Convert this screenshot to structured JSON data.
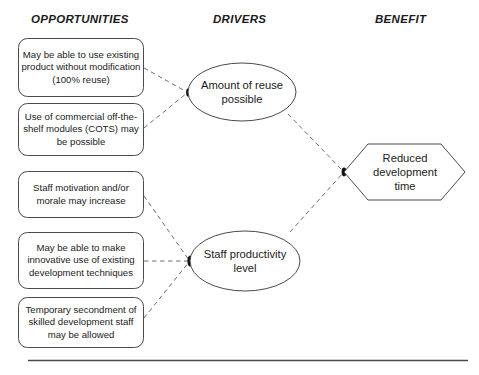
{
  "columns": {
    "opportunities": "OPPORTUNITIES",
    "drivers": "DRIVERS",
    "benefit": "BENEFIT"
  },
  "opportunities": [
    {
      "id": "opp-existing-product",
      "text": "May be able to use existing product without modification (100% reuse)"
    },
    {
      "id": "opp-cots-modules",
      "text": "Use of commercial off-the-shelf  modules (COTS) may be possible"
    },
    {
      "id": "opp-staff-motivation",
      "text": "Staff motivation and/or morale may increase"
    },
    {
      "id": "opp-innovative-use",
      "text": "May be able to make innovative use of existing development techniques"
    },
    {
      "id": "opp-secondment",
      "text": "Temporary secondment of skilled development staff may be allowed"
    }
  ],
  "drivers": [
    {
      "id": "driver-reuse",
      "text": "Amount of reuse possible"
    },
    {
      "id": "driver-productivity",
      "text": "Staff productivity level"
    }
  ],
  "benefits": [
    {
      "id": "benefit-reduced-time",
      "text": "Reduced development time"
    }
  ],
  "colors": {
    "stroke": "#3b3b3b",
    "connector": "#6e6e6e",
    "text": "#1b1b1b",
    "rule": "#4a4a4a",
    "background": "#ffffff"
  },
  "footer": {
    "rule": "horizontal-divider"
  }
}
